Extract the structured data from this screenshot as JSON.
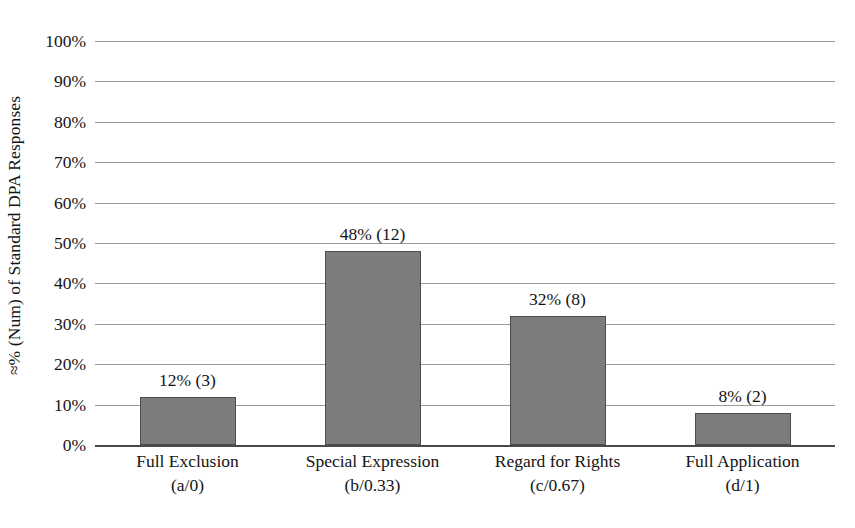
{
  "chart_data": {
    "type": "bar",
    "title": "",
    "xlabel": "",
    "ylabel": "≈% (Num) of Standard DPA Responses",
    "ylim": [
      0,
      100
    ],
    "grid": true,
    "legend": "none",
    "categories": [
      "Full Exclusion",
      "Special Expression",
      "Regard for Rights",
      "Full Application"
    ],
    "category_sublabels": [
      "(a/0)",
      "(b/0.33)",
      "(c/0.67)",
      "(d/1)"
    ],
    "values": [
      12,
      48,
      32,
      8
    ],
    "counts": [
      3,
      12,
      8,
      2
    ],
    "point_labels": [
      "12% (3)",
      "48% (12)",
      "32% (8)",
      "8% (2)"
    ],
    "ytick_labels": [
      "100%",
      "90%",
      "80%",
      "70%",
      "60%",
      "50%",
      "40%",
      "30%",
      "20%",
      "10%",
      "0%"
    ],
    "ytick_values": [
      100,
      90,
      80,
      70,
      60,
      50,
      40,
      30,
      20,
      10,
      0
    ],
    "colors": {
      "bar_fill": "#7c7c7c",
      "bar_border": "#4d4d4d",
      "gridline": "#9a9a9a",
      "axis": "#4a4a4a",
      "text": "#141414",
      "background": "#ffffff"
    }
  }
}
